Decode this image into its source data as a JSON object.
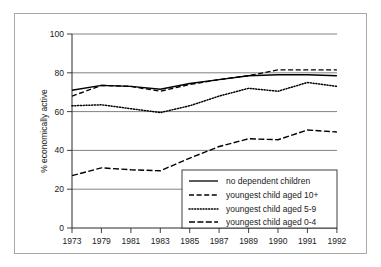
{
  "chart_data": {
    "type": "line",
    "title": "",
    "xlabel": "",
    "ylabel": "% economically active",
    "x": [
      "1973",
      "1979",
      "1981",
      "1983",
      "1985",
      "1987",
      "1989",
      "1990",
      "1991",
      "1992"
    ],
    "categories": [
      "1973",
      "1979",
      "1981",
      "1983",
      "1985",
      "1987",
      "1989",
      "1990",
      "1991",
      "1992"
    ],
    "ylim": [
      0,
      100
    ],
    "yticks": [
      0,
      20,
      40,
      60,
      80,
      100
    ],
    "ytick_labels": [
      "0",
      "20",
      "40",
      "60",
      "80",
      "100"
    ],
    "grid": "horizontal",
    "legend_position": "lower-right-inside",
    "series": [
      {
        "name": "no dependent children",
        "style": "solid",
        "values": [
          71,
          73.5,
          73,
          71.5,
          74.5,
          76.5,
          78.5,
          79,
          79,
          78.5
        ]
      },
      {
        "name": "youngest child aged 10+",
        "style": "dashed",
        "values": [
          68,
          73.5,
          73,
          70.5,
          74,
          76.5,
          78.5,
          81.5,
          81.5,
          81.5
        ]
      },
      {
        "name": "youngest child aged 5-9",
        "style": "dotted",
        "values": [
          63,
          63.5,
          61.5,
          59.5,
          63,
          68,
          72,
          70.5,
          75,
          73
        ]
      },
      {
        "name": "youngest child aged 0-4",
        "style": "dashdot",
        "values": [
          27,
          31,
          30,
          29.5,
          36,
          42,
          46,
          45.5,
          50.5,
          49.5
        ]
      }
    ]
  },
  "axes": {
    "y_axis_title": "% economically active",
    "y_tick_labels": [
      "100",
      "80",
      "60",
      "40",
      "20",
      "0"
    ],
    "x_tick_labels": [
      "1973",
      "1979",
      "1981",
      "1983",
      "1985",
      "1987",
      "1989",
      "1990",
      "1991",
      "1992"
    ]
  },
  "legend": {
    "entries": [
      {
        "label": "no dependent children",
        "style": "solid"
      },
      {
        "label": "youngest child aged 10+",
        "style": "dashed"
      },
      {
        "label": "youngest child aged 5-9",
        "style": "dotted"
      },
      {
        "label": "youngest child aged 0-4",
        "style": "dashdot"
      }
    ]
  },
  "colors": {
    "line": "#000000",
    "grid": "#4d4d4d",
    "axis": "#2b2b2b",
    "frame": "#a8a8a8",
    "background": "#ffffff"
  }
}
